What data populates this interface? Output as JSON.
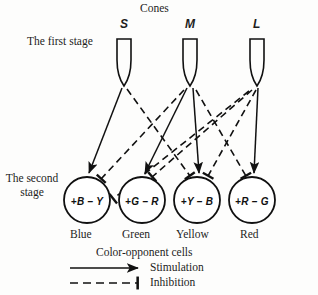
{
  "figure": {
    "cones_title": "Cones",
    "first_stage_label": "The first stage",
    "second_stage_label_line1": "The second",
    "second_stage_label_line2": "stage",
    "group_label": "Color-opponent cells",
    "line_color": "#111111",
    "background": "#fdfdfc"
  },
  "cones": [
    {
      "id": "s-cone",
      "label": "S",
      "x": 124
    },
    {
      "id": "m-cone",
      "label": "M",
      "x": 190
    },
    {
      "id": "l-cone",
      "label": "L",
      "x": 257
    }
  ],
  "opponent_cells": [
    {
      "id": "cell-blue",
      "formula": "+B – Y",
      "color_name": "Blue",
      "cx": 87
    },
    {
      "id": "cell-green",
      "formula": "+G – R",
      "color_name": "Green",
      "cx": 142
    },
    {
      "id": "cell-yellow",
      "formula": "+Y – B",
      "color_name": "Yellow",
      "cx": 197
    },
    {
      "id": "cell-red",
      "formula": "+R – G",
      "color_name": "Red",
      "cx": 252
    }
  ],
  "connections": {
    "stimulation": [
      {
        "from": "S",
        "to": "Blue"
      },
      {
        "from": "M",
        "to": "Green"
      },
      {
        "from": "M",
        "to": "Yellow"
      },
      {
        "from": "L",
        "to": "Red"
      }
    ],
    "inhibition": [
      {
        "from": "S",
        "to": "Yellow"
      },
      {
        "from": "M",
        "to": "Blue"
      },
      {
        "from": "M",
        "to": "Red"
      },
      {
        "from": "L",
        "to": "Green"
      },
      {
        "from": "L",
        "to": "Blue"
      },
      {
        "from": "L",
        "to": "Yellow"
      }
    ]
  },
  "legend": [
    {
      "id": "legend-stimulation",
      "label": "Stimulation",
      "style": "solid-arrow"
    },
    {
      "id": "legend-inhibition",
      "label": "Inhibition",
      "style": "dashed-bar"
    }
  ]
}
